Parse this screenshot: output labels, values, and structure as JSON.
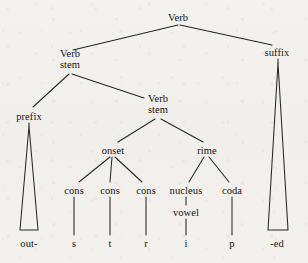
{
  "diagram": {
    "type": "linguistic-tree",
    "word": "outstripped",
    "ink_color": "#16120f",
    "paper_color": "#f2f0ed"
  },
  "nodes": {
    "root_verb": {
      "label": "Verb",
      "x": 178,
      "y": 17
    },
    "verb_stem_1": {
      "label_line1": "Verb",
      "label_line2": "stem",
      "x": 70,
      "y": 60
    },
    "suffix": {
      "label": "suffix",
      "x": 277,
      "y": 52
    },
    "prefix": {
      "label": "prefix",
      "x": 29,
      "y": 116
    },
    "verb_stem_2": {
      "label_line1": "Verb",
      "label_line2": "stem",
      "x": 158,
      "y": 105
    },
    "onset": {
      "label": "onset",
      "x": 113,
      "y": 150
    },
    "rime": {
      "label": "rime",
      "x": 207,
      "y": 150
    },
    "cons_1": {
      "label": "cons",
      "x": 74,
      "y": 190
    },
    "cons_2": {
      "label": "cons",
      "x": 110,
      "y": 190
    },
    "cons_3": {
      "label": "cons",
      "x": 146,
      "y": 190
    },
    "nucleus": {
      "label": "nucleus",
      "x": 186,
      "y": 190
    },
    "coda": {
      "label": "coda",
      "x": 232,
      "y": 190
    },
    "vowel": {
      "label": "vowel",
      "x": 186,
      "y": 212
    }
  },
  "terminals": {
    "prefix_text": {
      "label": "out-",
      "x": 29,
      "y": 243
    },
    "s": {
      "label": "s",
      "x": 74,
      "y": 243
    },
    "t": {
      "label": "t",
      "x": 110,
      "y": 243
    },
    "r": {
      "label": "r",
      "x": 146,
      "y": 243
    },
    "i": {
      "label": "i",
      "x": 186,
      "y": 243
    },
    "p": {
      "label": "p",
      "x": 232,
      "y": 243
    },
    "suffix_text": {
      "label": "-ed",
      "x": 277,
      "y": 243
    }
  },
  "triangles": {
    "prefix_triangle": {
      "apex_x": 29,
      "apex_y": 125,
      "base_y": 230,
      "base_left_x": 20,
      "base_right_x": 38
    },
    "suffix_triangle": {
      "apex_x": 278,
      "apex_y": 62,
      "base_y": 230,
      "base_left_x": 268,
      "base_right_x": 288
    }
  }
}
